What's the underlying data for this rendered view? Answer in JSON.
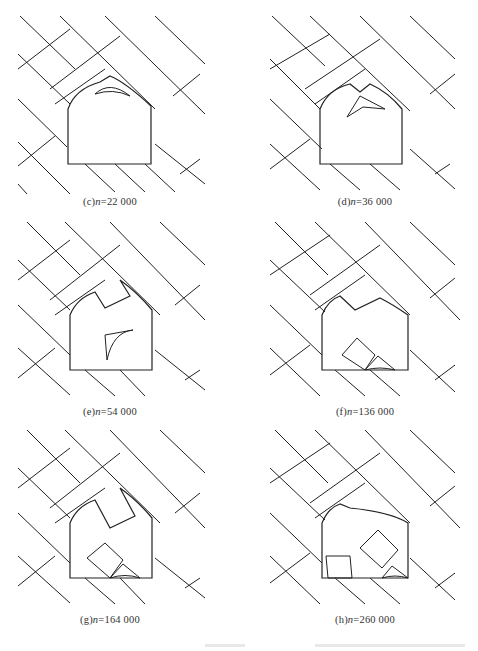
{
  "figure": {
    "panels": [
      {
        "id": "c",
        "label_prefix": "(c)",
        "var": "n",
        "eq": "=",
        "value": "22 000"
      },
      {
        "id": "d",
        "label_prefix": "(d)",
        "var": "n",
        "eq": "=",
        "value": "36 000"
      },
      {
        "id": "e",
        "label_prefix": "(e)",
        "var": "n",
        "eq": "=",
        "value": "54 000"
      },
      {
        "id": "f",
        "label_prefix": "(f)",
        "var": "n",
        "eq": "=",
        "value": "136 000"
      },
      {
        "id": "g",
        "label_prefix": "(g)",
        "var": "n",
        "eq": "=",
        "value": "164 000"
      },
      {
        "id": "h",
        "label_prefix": "(h)",
        "var": "n",
        "eq": "=",
        "value": "260 000"
      }
    ]
  }
}
